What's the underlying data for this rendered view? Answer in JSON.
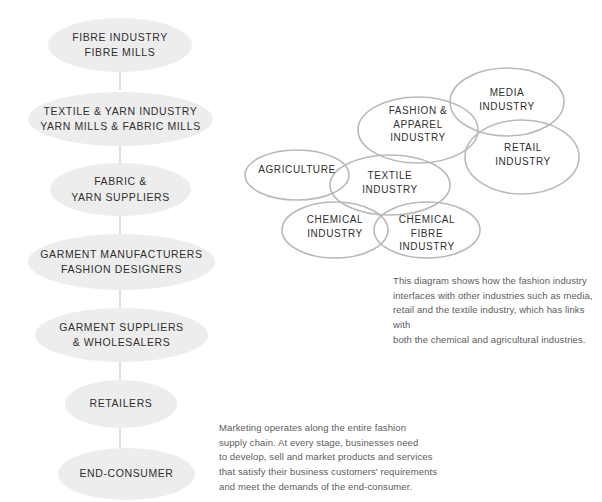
{
  "flow": {
    "name": "fashion-supply-chain-flow",
    "nodes": [
      {
        "line1": "FIBRE INDUSTRY",
        "line2": "FIBRE MILLS"
      },
      {
        "line1": "TEXTILE & YARN INDUSTRY",
        "line2": "YARN MILLS & FABRIC MILLS"
      },
      {
        "line1": "FABRIC &",
        "line2": "YARN SUPPLIERS"
      },
      {
        "line1": "GARMENT MANUFACTURERS",
        "line2": "FASHION DESIGNERS"
      },
      {
        "line1": "GARMENT SUPPLIERS",
        "line2": "& WHOLESALERS"
      },
      {
        "line1": "RETAILERS",
        "line2": ""
      },
      {
        "line1": "END-CONSUMER",
        "line2": ""
      }
    ]
  },
  "venn": {
    "name": "industry-interfaces-venn",
    "ellipses": [
      {
        "id": "media",
        "line1": "MEDIA",
        "line2": "INDUSTRY",
        "line3": ""
      },
      {
        "id": "fashion-apparel",
        "line1": "FASHION &",
        "line2": "APPAREL",
        "line3": "INDUSTRY"
      },
      {
        "id": "retail",
        "line1": "RETAIL",
        "line2": "INDUSTRY",
        "line3": ""
      },
      {
        "id": "agriculture",
        "line1": "AGRICULTURE",
        "line2": "",
        "line3": ""
      },
      {
        "id": "textile",
        "line1": "TEXTILE",
        "line2": "INDUSTRY",
        "line3": ""
      },
      {
        "id": "chemical",
        "line1": "CHEMICAL",
        "line2": "INDUSTRY",
        "line3": ""
      },
      {
        "id": "chemical-fibre",
        "line1": "CHEMICAL",
        "line2": "FIBRE",
        "line3": "INDUSTRY"
      }
    ]
  },
  "captions": {
    "venn_caption": "This diagram shows how the fashion industry interfaces with other industries such as media, retail and the textile industry, which has links with both the chemical and agricultural industries.",
    "venn_caption_lines": [
      "This diagram shows how the fashion industry",
      "interfaces with other industries such as media,",
      "retail and the textile industry, which has links with",
      "both the chemical and agricultural industries."
    ],
    "flow_caption": "Marketing operates along the entire fashion supply chain. At every stage, businesses need to develop, sell and market products and services that satisfy their business customers' requirements and meet the demands of the end-consumer.",
    "flow_caption_lines": [
      "Marketing operates along the entire fashion",
      "supply chain. At every stage, businesses need",
      "to develop, sell and market products and services",
      "that satisfy their business customers' requirements",
      "and meet the demands of the end-consumer."
    ]
  },
  "colors": {
    "node_fill": "#ededed",
    "ellipse_stroke": "#b9b9b9",
    "connector": "#d2d2d2",
    "text": "#2f2f2f",
    "caption_text": "#5c5c5c",
    "background": "#ffffff"
  }
}
